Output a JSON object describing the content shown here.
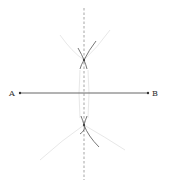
{
  "diagram": {
    "type": "perpendicular-bisector-construction",
    "colors": {
      "segment": "#555555",
      "bisector": "#b5b5b5",
      "arc_dark": "#666666",
      "arc_faint": "#e6e6e6",
      "label": "#333333"
    },
    "points": [
      {
        "label": "A",
        "x": 17,
        "y": 93
      },
      {
        "label": "B",
        "x": 149,
        "y": 93
      }
    ],
    "segment": {
      "from": "A",
      "to": "B"
    },
    "bisector": {
      "x": 84,
      "y_top": 8,
      "y_bottom": 180,
      "style": "dashed"
    },
    "intersections": [
      {
        "x": 84,
        "y": 60
      },
      {
        "x": 84,
        "y": 125
      }
    ]
  }
}
